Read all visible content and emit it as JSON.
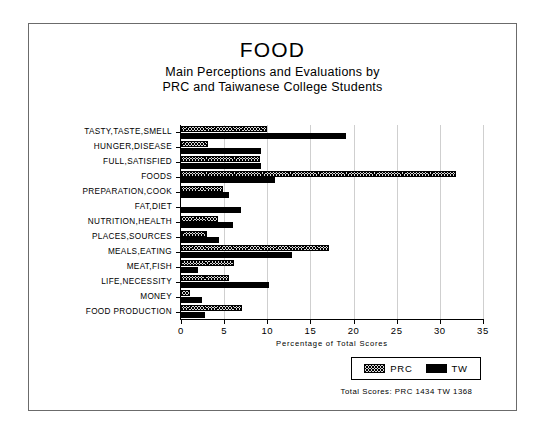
{
  "chart_data": {
    "type": "bar",
    "orientation": "horizontal",
    "title": "FOOD",
    "subtitle_line_1": "Main Perceptions and Evaluations by",
    "subtitle_line_2": "PRC and Taiwanese College Students",
    "xlabel": "Percentage of Total Scores",
    "ylabel": "",
    "xlim": [
      0,
      35
    ],
    "xticks": [
      0,
      5,
      10,
      15,
      20,
      25,
      30,
      35
    ],
    "grid": true,
    "grid_axis": "x",
    "legend_position": "bottom-right",
    "categories": [
      "TASTY,TASTE,SMELL",
      "HUNGER,DISEASE",
      "FULL,SATISFIED",
      "FOODS",
      "PREPARATION,COOK",
      "FAT,DIET",
      "NUTRITION,HEALTH",
      "PLACES,SOURCES",
      "MEALS,EATING",
      "MEAT,FISH",
      "LIFE,NECESSITY",
      "MONEY",
      "FOOD PRODUCTION"
    ],
    "series": [
      {
        "name": "PRC",
        "pattern": "hatched",
        "color": "#d9d9d9",
        "values": [
          10.0,
          3.1,
          9.2,
          31.9,
          4.9,
          0.0,
          4.3,
          3.0,
          17.2,
          6.2,
          5.6,
          1.0,
          7.1
        ]
      },
      {
        "name": "TW",
        "pattern": "solid",
        "color": "#000000",
        "values": [
          19.1,
          9.3,
          9.3,
          10.9,
          5.6,
          7.0,
          6.0,
          4.4,
          12.9,
          2.0,
          10.2,
          2.4,
          2.8
        ]
      }
    ],
    "annotations": {
      "footnote": "Total Scores:  PRC 1434   TW 1368"
    }
  },
  "legend": {
    "entries": [
      {
        "label": "PRC"
      },
      {
        "label": "TW"
      }
    ]
  }
}
